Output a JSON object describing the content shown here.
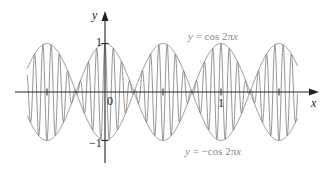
{
  "chart_data": {
    "type": "line",
    "title": "",
    "xlabel": "x",
    "ylabel": "y",
    "xlim": [
      -0.67,
      1.66
    ],
    "ylim": [
      -1,
      1
    ],
    "grid": false,
    "legend_position": "inline annotations",
    "x_ticks": [
      -0.5,
      0,
      0.5,
      1,
      1.5
    ],
    "x_tick_labels": [
      {
        "value": 0,
        "label": "0"
      },
      {
        "value": 1,
        "label": "1"
      }
    ],
    "y_tick_labels": [
      {
        "value": 1,
        "label": "1"
      },
      {
        "value": -1,
        "label": "−1"
      }
    ],
    "series": [
      {
        "name": "y = cos 2πx",
        "formula": "cos(2*pi*x)",
        "role": "upper envelope",
        "color": "#8a8a8a"
      },
      {
        "name": "y = −cos 2πx",
        "formula": "-cos(2*pi*x)",
        "role": "lower envelope",
        "color": "#8a8a8a"
      },
      {
        "name": "modulated curve",
        "formula": "cos(2*pi*x)*cos(28*pi*x)",
        "role": "fast oscillation bounded by envelopes",
        "color": "#7a7a7a"
      }
    ],
    "annotations": [
      {
        "text": "y = cos 2πx",
        "position": "upper right"
      },
      {
        "text": "y = −cos 2πx",
        "position": "lower right"
      }
    ]
  },
  "labels": {
    "y_axis": "y",
    "x_axis": "x",
    "origin": "0",
    "y_one": "1",
    "y_neg_one": "−1",
    "x_one": "1",
    "cos_label_y": "y",
    "cos_label_eq": " = cos 2π",
    "cos_label_x": "x",
    "negcos_label_y": "y",
    "negcos_label_eq": " = −cos 2π",
    "negcos_label_x": "x"
  },
  "layout": {
    "origin_px": [
      105,
      92
    ],
    "x_px_per_unit": 116,
    "y_px_per_unit": 48.5,
    "curve_color": "#8a8a8a",
    "axis_color": "#222222"
  }
}
